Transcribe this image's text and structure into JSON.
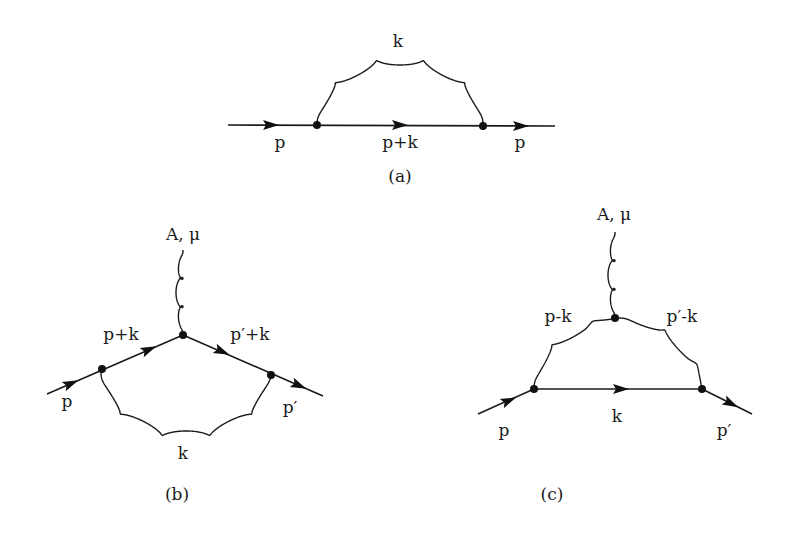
{
  "figure": {
    "colors": {
      "ink": "#1a1a1a",
      "background": "#ffffff"
    },
    "diagrams": [
      {
        "id": "a",
        "caption": "(a)",
        "labels": {
          "gluon": "k",
          "incoming": "p",
          "internal": "p+k",
          "outgoing": "p"
        }
      },
      {
        "id": "b",
        "caption": "(b)",
        "labels": {
          "external": "A, μ",
          "incoming": "p",
          "left_internal": "p+k",
          "right_internal": "p′+k",
          "outgoing": "p′",
          "gluon": "k"
        }
      },
      {
        "id": "c",
        "caption": "(c)",
        "labels": {
          "external": "A, μ",
          "left_gluon": "p-k",
          "right_gluon": "p′-k",
          "incoming": "p",
          "internal": "k",
          "outgoing": "p′"
        }
      }
    ]
  }
}
